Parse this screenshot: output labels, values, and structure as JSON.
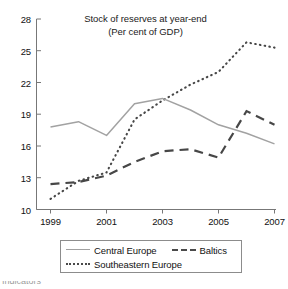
{
  "chart_data": {
    "type": "line",
    "title": "Stock of reserves at year-end",
    "subtitle": "(Per cent of GDP)",
    "xlabel": "",
    "ylabel": "",
    "x": [
      1999,
      2000,
      2001,
      2002,
      2003,
      2004,
      2005,
      2006,
      2007
    ],
    "xlim": [
      1999,
      2007
    ],
    "ylim": [
      10,
      28
    ],
    "yticks": [
      10,
      13,
      16,
      19,
      22,
      25,
      28
    ],
    "xticks": [
      1999,
      2001,
      2003,
      2005,
      2007
    ],
    "xminorticks": [
      2000,
      2002,
      2004,
      2006
    ],
    "grid": false,
    "legend_position": "bottom",
    "series": [
      {
        "name": "Central Europe",
        "style": "solid",
        "color": "#a0a0a0",
        "values": [
          17.8,
          18.3,
          17.0,
          20.0,
          20.5,
          19.4,
          18.0,
          17.2,
          16.2
        ]
      },
      {
        "name": "Baltics",
        "style": "dashed",
        "color": "#4a4a4a",
        "values": [
          12.4,
          12.6,
          13.2,
          14.5,
          15.5,
          15.7,
          14.9,
          19.3,
          18.0
        ]
      },
      {
        "name": "Southeastern Europe",
        "style": "dotted",
        "color": "#4a4a4a",
        "values": [
          11.0,
          12.7,
          13.5,
          18.5,
          20.3,
          21.8,
          23.0,
          25.8,
          25.3
        ]
      }
    ]
  },
  "title": {
    "line1": "Stock of reserves at year-end",
    "line2": "(Per cent of GDP)"
  },
  "axes": {
    "y_labels": [
      "28",
      "25",
      "22",
      "19",
      "16",
      "13",
      "10"
    ],
    "x_labels": [
      "1999",
      "2001",
      "2003",
      "2005",
      "2007"
    ]
  },
  "legend": {
    "items": [
      {
        "label": "Central Europe",
        "style": "solid"
      },
      {
        "label": "Baltics",
        "style": "dashed"
      },
      {
        "label": "Southeastern Europe",
        "style": "dotted"
      }
    ]
  },
  "footer": {
    "cropped_text": "Indicators"
  }
}
